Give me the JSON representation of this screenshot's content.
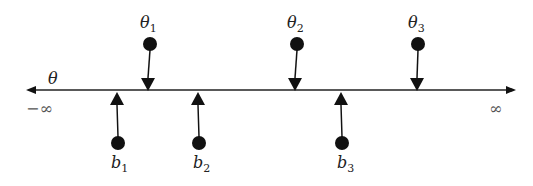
{
  "diagram": {
    "axis": {
      "label": "θ",
      "left_label": "−∞",
      "right_label": "∞",
      "y": 90,
      "x_start": 26,
      "x_end": 516
    },
    "thetas": [
      {
        "name": "θ",
        "sub": "1",
        "x": 149
      },
      {
        "name": "θ",
        "sub": "2",
        "x": 296
      },
      {
        "name": "θ",
        "sub": "3",
        "x": 417
      }
    ],
    "bs": [
      {
        "name": "b",
        "sub": "1",
        "x": 118
      },
      {
        "name": "b",
        "sub": "2",
        "x": 199
      },
      {
        "name": "b",
        "sub": "3",
        "x": 342
      }
    ],
    "colors": {
      "ink": "#111111",
      "background": "#ffffff"
    }
  }
}
